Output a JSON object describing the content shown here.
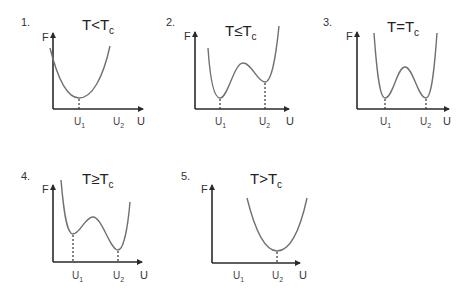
{
  "figure": {
    "axis_x_label": "U",
    "axis_y_label": "F",
    "colors": {
      "axis": "#2a2a2a",
      "curve": "#707070",
      "text": "#222222"
    }
  },
  "panels": [
    {
      "number": "1.",
      "title_main": "T<T",
      "title_sub": "c",
      "u1_label": "U",
      "u1_sub": "1",
      "u2_label": "U",
      "u2_sub": "2",
      "shape": "single well, minimum at U1",
      "curve_path": "M50,48 C58,80 68,98 79,98 C92,98 103,78 110,46",
      "dashes": [
        [
          79,
          98
        ]
      ]
    },
    {
      "number": "2.",
      "title_main": "T≤T",
      "title_sub": "c",
      "u1_label": "U",
      "u1_sub": "1",
      "u2_label": "U",
      "u2_sub": "2",
      "shape": "double well, U1 deeper than U2",
      "curve_path": "M208,48 C210,78 214,98 220,98 C228,98 234,63 243,63 C252,63 257,82 265,82 C272,82 276,55 279,26",
      "dashes": [
        [
          220,
          98
        ],
        [
          265,
          82
        ]
      ]
    },
    {
      "number": "3.",
      "title_main": "T=T",
      "title_sub": "c",
      "u1_label": "U",
      "u1_sub": "1",
      "u2_label": "U",
      "u2_sub": "2",
      "shape": "double well, equal minima",
      "curve_path": "M374,33 C377,75 380,98 385,98 C393,98 397,67 405,67 C413,67 418,98 426,98 C431,98 434,75 437,33",
      "dashes": [
        [
          385,
          98
        ],
        [
          426,
          98
        ]
      ]
    },
    {
      "number": "4.",
      "title_main": "T≥T",
      "title_sub": "c",
      "u1_label": "U",
      "u1_sub": "1",
      "u2_label": "U",
      "u2_sub": "2",
      "shape": "double well, U2 deeper than U1",
      "curve_path": "M61,180 C64,215 67,234 73,234 C80,234 85,217 93,217 C102,217 110,250 118,250 C124,250 128,225 130,202",
      "dashes": [
        [
          73,
          234
        ],
        [
          118,
          250
        ]
      ]
    },
    {
      "number": "5.",
      "title_main": "T>T",
      "title_sub": "c",
      "u1_label": "U",
      "u1_sub": "1",
      "u2_label": "U",
      "u2_sub": "2",
      "shape": "single well, minimum at U2",
      "curve_path": "M247,198 C255,230 265,251 277,251 C290,251 300,230 307,198",
      "dashes": [
        [
          277,
          251
        ]
      ]
    }
  ]
}
